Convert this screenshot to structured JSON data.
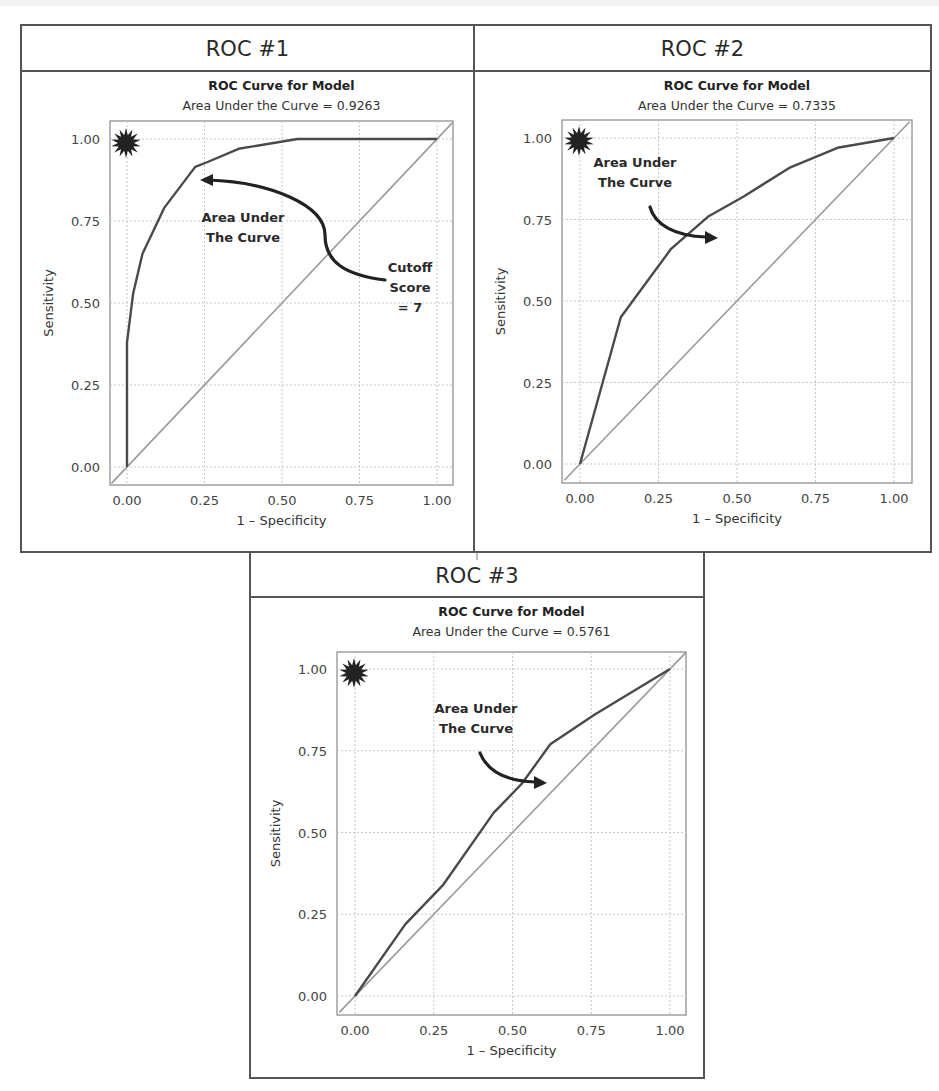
{
  "panels": [
    {
      "id": "roc1",
      "header": "ROC #1",
      "chart_title": "ROC Curve for Model",
      "chart_subtitle": "Area Under the Curve = 0.9263",
      "x_label": "1 – Specificity",
      "y_label": "Sensitivity",
      "annotations": [
        {
          "lines": [
            "Area Under",
            "The Curve"
          ],
          "x": 243,
          "y": 222
        },
        {
          "lines": [
            "Cutoff",
            "Score",
            "= 7"
          ],
          "x": 410,
          "y": 272
        }
      ],
      "frame": {
        "left": 21,
        "top": 25,
        "right": 474,
        "bottom": 552,
        "header_bottom": 71
      },
      "plot": {
        "left": 110,
        "top": 121,
        "right": 453,
        "bottom": 485,
        "x0": 127,
        "x1": 437,
        "y0": 467,
        "y1": 139
      },
      "arrow": {
        "path": "M385,280 C345,275 325,262 325,235 C325,205 270,182 208,180",
        "head": [
          200,
          180,
          "left"
        ]
      },
      "star": {
        "cx": 126,
        "cy": 143
      }
    },
    {
      "id": "roc2",
      "header": "ROC #2",
      "chart_title": "ROC Curve for Model",
      "chart_subtitle": "Area Under the Curve = 0.7335",
      "x_label": "1 – Specificity",
      "y_label": "Sensitivity",
      "annotations": [
        {
          "lines": [
            "Area Under",
            "The Curve"
          ],
          "x": 635,
          "y": 167
        }
      ],
      "frame": {
        "left": 474,
        "top": 25,
        "right": 931,
        "bottom": 552,
        "header_bottom": 71
      },
      "plot": {
        "left": 562,
        "top": 120,
        "right": 912,
        "bottom": 483,
        "x0": 580,
        "x1": 894,
        "y0": 464,
        "y1": 138
      },
      "arrow": {
        "path": "M650,207 C655,225 675,236 706,237",
        "head": [
          718,
          238,
          "right"
        ]
      },
      "star": {
        "cx": 579,
        "cy": 141
      }
    },
    {
      "id": "roc3",
      "header": "ROC #3",
      "chart_title": "ROC Curve for Model",
      "chart_subtitle": "Area Under the Curve = 0.5761",
      "x_label": "1 – Specificity",
      "y_label": "Sensitivity",
      "annotations": [
        {
          "lines": [
            "Area Under",
            "The Curve"
          ],
          "x": 476,
          "y": 713
        }
      ],
      "frame": {
        "left": 250,
        "top": 552,
        "right": 704,
        "bottom": 1078,
        "header_bottom": 597
      },
      "plot": {
        "left": 337,
        "top": 652,
        "right": 686,
        "bottom": 1015,
        "x0": 355,
        "x1": 670,
        "y0": 996,
        "y1": 669
      },
      "arrow": {
        "path": "M480,753 C487,770 505,781 535,782",
        "head": [
          547,
          783,
          "right"
        ]
      },
      "star": {
        "cx": 354,
        "cy": 673
      }
    }
  ],
  "chart_data": [
    {
      "type": "line",
      "title": "ROC Curve for Model",
      "subtitle": "Area Under the Curve = 0.9263",
      "panel_label": "ROC #1",
      "xlabel": "1 – Specificity",
      "ylabel": "Sensitivity",
      "xlim": [
        -0.05,
        1.05
      ],
      "ylim": [
        -0.05,
        1.05
      ],
      "xticks": [
        "0.00",
        "0.25",
        "0.50",
        "0.75",
        "1.00"
      ],
      "yticks": [
        "0.00",
        "0.25",
        "0.50",
        "0.75",
        "1.00"
      ],
      "grid": true,
      "auc": 0.9263,
      "series": [
        {
          "name": "ROC",
          "x": [
            0.0,
            0.0,
            0.02,
            0.05,
            0.12,
            0.22,
            0.26,
            0.36,
            0.55,
            1.0
          ],
          "y": [
            0.0,
            0.38,
            0.53,
            0.65,
            0.79,
            0.915,
            0.93,
            0.97,
            1.0,
            1.0
          ]
        },
        {
          "name": "Reference",
          "x": [
            -0.05,
            1.05
          ],
          "y": [
            -0.05,
            1.05
          ]
        }
      ],
      "annotations": [
        "Area Under The Curve",
        "Cutoff Score = 7"
      ]
    },
    {
      "type": "line",
      "title": "ROC Curve for Model",
      "subtitle": "Area Under the Curve = 0.7335",
      "panel_label": "ROC #2",
      "xlabel": "1 – Specificity",
      "ylabel": "Sensitivity",
      "xlim": [
        -0.05,
        1.05
      ],
      "ylim": [
        -0.05,
        1.05
      ],
      "xticks": [
        "0.00",
        "0.25",
        "0.50",
        "0.75",
        "1.00"
      ],
      "yticks": [
        "0.00",
        "0.25",
        "0.50",
        "0.75",
        "1.00"
      ],
      "grid": true,
      "auc": 0.7335,
      "series": [
        {
          "name": "ROC",
          "x": [
            0.0,
            0.13,
            0.29,
            0.41,
            0.52,
            0.67,
            0.82,
            1.0
          ],
          "y": [
            0.0,
            0.45,
            0.66,
            0.76,
            0.82,
            0.91,
            0.97,
            1.0
          ]
        },
        {
          "name": "Reference",
          "x": [
            -0.05,
            1.05
          ],
          "y": [
            -0.05,
            1.05
          ]
        }
      ],
      "annotations": [
        "Area Under The Curve"
      ]
    },
    {
      "type": "line",
      "title": "ROC Curve for Model",
      "subtitle": "Area Under the Curve = 0.5761",
      "panel_label": "ROC #3",
      "xlabel": "1 – Specificity",
      "ylabel": "Sensitivity",
      "xlim": [
        -0.05,
        1.05
      ],
      "ylim": [
        -0.05,
        1.05
      ],
      "xticks": [
        "0.00",
        "0.25",
        "0.50",
        "0.75",
        "1.00"
      ],
      "yticks": [
        "0.00",
        "0.25",
        "0.50",
        "0.75",
        "1.00"
      ],
      "grid": true,
      "auc": 0.5761,
      "series": [
        {
          "name": "ROC",
          "x": [
            0.0,
            0.16,
            0.28,
            0.44,
            0.53,
            0.62,
            0.76,
            1.0
          ],
          "y": [
            0.0,
            0.22,
            0.34,
            0.56,
            0.65,
            0.77,
            0.86,
            1.0
          ]
        },
        {
          "name": "Reference",
          "x": [
            -0.05,
            1.05
          ],
          "y": [
            -0.05,
            1.05
          ]
        }
      ],
      "annotations": [
        "Area Under The Curve"
      ]
    }
  ],
  "icons": {
    "star": "starburst-icon"
  }
}
